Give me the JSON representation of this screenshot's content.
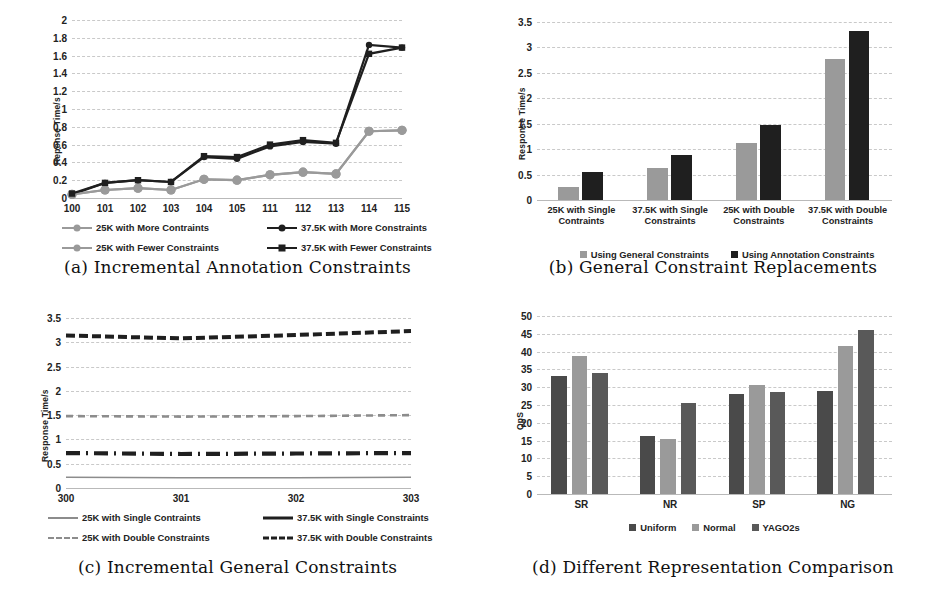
{
  "figure": {
    "panels": [
      {
        "key": "a",
        "caption": "(a) Incremental Annotation Constraints"
      },
      {
        "key": "b",
        "caption": "(b) General Constraint Replacements"
      },
      {
        "key": "c",
        "caption": "(c) Incremental General Constraints"
      },
      {
        "key": "d",
        "caption": "(d) Different Representation Comparison"
      }
    ]
  },
  "colors": {
    "light_gray": "#9a9a9a",
    "mid_gray": "#8c8c8c",
    "dark_gray": "#4a4a4a",
    "near_black": "#1f1f1f",
    "grid": "#c9c9c9",
    "axis": "#b9b9b9"
  },
  "chart_data": [
    {
      "id": "a",
      "type": "line",
      "title": "(a) Incremental Annotation Constraints",
      "xlabel": "",
      "ylabel": "Reponse Time/s",
      "ylim": [
        0,
        2
      ],
      "yticks": [
        0,
        0.2,
        0.4,
        0.6,
        0.8,
        1,
        1.2,
        1.4,
        1.6,
        1.8,
        2
      ],
      "ytick_labels": [
        "0",
        "0.2",
        "0.4",
        "0.6",
        "0.8",
        "1",
        "1.2",
        "1.4",
        "1.6",
        "1.8",
        "2"
      ],
      "grid": true,
      "legend_position": "bottom",
      "categories": [
        "100",
        "101",
        "102",
        "103",
        "104",
        "105",
        "111",
        "112",
        "113",
        "114",
        "115"
      ],
      "series": [
        {
          "name": "25K with More Contraints",
          "color": "#9a9a9a",
          "marker": "circle",
          "values": [
            0.04,
            0.09,
            0.11,
            0.09,
            0.21,
            0.2,
            0.26,
            0.29,
            0.27,
            0.75,
            0.76
          ]
        },
        {
          "name": "37.5K with More Constraints",
          "color": "#1f1f1f",
          "marker": "circle",
          "values": [
            0.04,
            0.17,
            0.2,
            0.18,
            0.46,
            0.44,
            0.58,
            0.63,
            0.61,
            1.72,
            1.69
          ]
        },
        {
          "name": "25K with Fewer Constraints",
          "color": "#9a9a9a",
          "marker": "circle",
          "values": [
            0.04,
            0.09,
            0.11,
            0.09,
            0.21,
            0.2,
            0.26,
            0.29,
            0.27,
            0.75,
            0.76
          ]
        },
        {
          "name": "37.5K with Fewer Constraints",
          "color": "#1f1f1f",
          "marker": "square",
          "values": [
            0.05,
            0.17,
            0.2,
            0.18,
            0.47,
            0.46,
            0.6,
            0.65,
            0.62,
            1.62,
            1.69
          ]
        }
      ]
    },
    {
      "id": "b",
      "type": "bar",
      "title": "(b) General Constraint Replacements",
      "xlabel": "",
      "ylabel": "Response Time/s",
      "ylim": [
        0,
        3.5
      ],
      "yticks": [
        0,
        0.5,
        1,
        1.5,
        2,
        2.5,
        3,
        3.5
      ],
      "ytick_labels": [
        "0",
        "0.5",
        "1",
        "1.5",
        "2",
        "2.5",
        "3",
        "3.5"
      ],
      "grid": true,
      "legend_position": "bottom",
      "categories": [
        "25K with Single Contraints",
        "37.5K with Single Constraints",
        "25K with Double Constraints",
        "37.5K with Double Constraints"
      ],
      "series": [
        {
          "name": "Using General Constraints",
          "color": "#9a9a9a",
          "values": [
            0.26,
            0.62,
            1.13,
            2.77
          ]
        },
        {
          "name": "Using Annotation Constraints",
          "color": "#1f1f1f",
          "values": [
            0.55,
            0.88,
            1.47,
            3.32
          ]
        }
      ]
    },
    {
      "id": "c",
      "type": "line",
      "title": "(c) Incremental General Constraints",
      "xlabel": "",
      "ylabel": "Response Time/s",
      "ylim": [
        0,
        3.5
      ],
      "yticks": [
        0,
        0.5,
        1,
        1.5,
        2,
        2.5,
        3,
        3.5
      ],
      "ytick_labels": [
        "0",
        "0.5",
        "1",
        "1.5",
        "2",
        "2.5",
        "3",
        "3.5"
      ],
      "grid": true,
      "legend_position": "bottom",
      "categories": [
        "300",
        "301",
        "302",
        "303"
      ],
      "series": [
        {
          "name": "25K with Single Contraints",
          "color": "#8c8c8c",
          "dash": "solid",
          "values": [
            0.22,
            0.21,
            0.21,
            0.22
          ]
        },
        {
          "name": "37.5K with Single Constraints",
          "color": "#1f1f1f",
          "dash": "dashdot",
          "values": [
            0.72,
            0.7,
            0.71,
            0.72
          ]
        },
        {
          "name": "25K with Double Constraints",
          "color": "#8c8c8c",
          "dash": "dashed",
          "values": [
            1.48,
            1.47,
            1.48,
            1.5
          ]
        },
        {
          "name": "37.5K with Double Constraints",
          "color": "#1f1f1f",
          "dash": "longdash",
          "values": [
            3.14,
            3.08,
            3.15,
            3.23
          ]
        }
      ]
    },
    {
      "id": "d",
      "type": "bar",
      "title": "(d) Different Representation Comparison",
      "xlabel": "",
      "ylabel": "QpS",
      "ylim": [
        0,
        50
      ],
      "yticks": [
        0,
        5,
        10,
        15,
        20,
        25,
        30,
        35,
        40,
        45,
        50
      ],
      "ytick_labels": [
        "0",
        "5",
        "10",
        "15",
        "20",
        "25",
        "30",
        "35",
        "40",
        "45",
        "50"
      ],
      "grid": true,
      "legend_position": "bottom",
      "categories": [
        "SR",
        "NR",
        "SP",
        "NG"
      ],
      "series": [
        {
          "name": "Uniform",
          "color": "#4a4a4a",
          "values": [
            33.2,
            16.4,
            28.1,
            28.8
          ]
        },
        {
          "name": "Normal",
          "color": "#9a9a9a",
          "values": [
            38.8,
            15.5,
            30.6,
            41.7
          ]
        },
        {
          "name": "YAGO2s",
          "color": "#595959",
          "values": [
            33.9,
            25.6,
            28.7,
            46.0
          ]
        }
      ]
    }
  ]
}
